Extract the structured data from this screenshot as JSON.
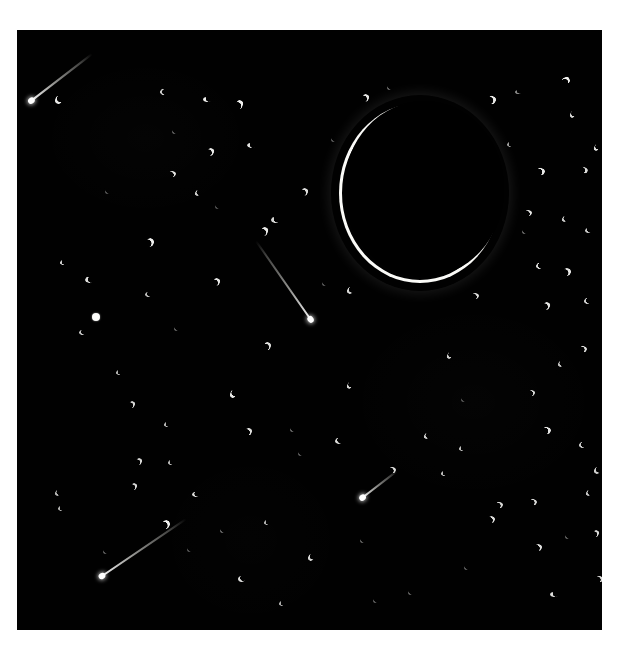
{
  "page": {
    "background_color": "#ffffff",
    "caption": "",
    "plate": {
      "label": "night-sky-exposure",
      "background_color": "#000000",
      "left": 17,
      "top": 30,
      "width": 585,
      "height": 600
    }
  },
  "scene": {
    "title": "Night sky long exposure with crescent moon",
    "moon": {
      "name": "crescent-moon",
      "shape": "thin crescent ring, open toward upper-right",
      "color": "#ffffff",
      "center_x": 403,
      "center_y": 163,
      "radius": 81,
      "ring_thickness_px": 6,
      "brightest_region": "bottom-left limb"
    },
    "streak_color": "#e8e8e4",
    "star_color": "#fdfdfb",
    "star_shape": "small crescent / comma-shaped blobs",
    "counts": {
      "stars": 96,
      "meteor_streaks": 4
    },
    "meteors": [
      {
        "name": "meteor-streak-top-left",
        "x1": 92,
        "y1": 54,
        "x2": 31,
        "y2": 101,
        "length": 77,
        "angle_deg": 142
      },
      {
        "name": "meteor-streak-center",
        "x1": 256,
        "y1": 241,
        "x2": 311,
        "y2": 320,
        "length": 96,
        "angle_deg": 55
      },
      {
        "name": "meteor-streak-bottom-mid",
        "x1": 397,
        "y1": 471,
        "x2": 362,
        "y2": 498,
        "length": 44,
        "angle_deg": 142
      },
      {
        "name": "meteor-streak-bottom-left",
        "x1": 186,
        "y1": 519,
        "x2": 102,
        "y2": 576,
        "length": 101,
        "angle_deg": 146
      }
    ],
    "stars": [
      {
        "x": 38,
        "y": 66,
        "w": 7,
        "h": 8,
        "r": 10,
        "o": 0.92
      },
      {
        "x": 143,
        "y": 59,
        "w": 6,
        "h": 6,
        "r": 40,
        "o": 0.8
      },
      {
        "x": 186,
        "y": 67,
        "w": 8,
        "h": 5,
        "r": 5,
        "o": 0.95
      },
      {
        "x": 219,
        "y": 70,
        "w": 7,
        "h": 9,
        "r": 195,
        "o": 0.95
      },
      {
        "x": 345,
        "y": 64,
        "w": 7,
        "h": 8,
        "r": 200,
        "o": 0.9
      },
      {
        "x": 370,
        "y": 56,
        "w": 4,
        "h": 4,
        "r": 0,
        "o": 0.45
      },
      {
        "x": 471,
        "y": 66,
        "w": 8,
        "h": 8,
        "r": 210,
        "o": 0.92
      },
      {
        "x": 498,
        "y": 60,
        "w": 6,
        "h": 4,
        "r": 0,
        "o": 0.55
      },
      {
        "x": 545,
        "y": 47,
        "w": 8,
        "h": 7,
        "r": 160,
        "o": 0.95
      },
      {
        "x": 553,
        "y": 81,
        "w": 5,
        "h": 7,
        "r": 15,
        "o": 0.85
      },
      {
        "x": 190,
        "y": 118,
        "w": 7,
        "h": 8,
        "r": 205,
        "o": 0.92
      },
      {
        "x": 230,
        "y": 113,
        "w": 8,
        "h": 5,
        "r": 10,
        "o": 0.9
      },
      {
        "x": 155,
        "y": 100,
        "w": 4,
        "h": 4,
        "r": 0,
        "o": 0.4
      },
      {
        "x": 577,
        "y": 114,
        "w": 5,
        "h": 7,
        "r": 20,
        "o": 0.88
      },
      {
        "x": 152,
        "y": 141,
        "w": 7,
        "h": 6,
        "r": 190,
        "o": 0.9
      },
      {
        "x": 178,
        "y": 160,
        "w": 5,
        "h": 6,
        "r": 25,
        "o": 0.82
      },
      {
        "x": 520,
        "y": 138,
        "w": 8,
        "h": 7,
        "r": 200,
        "o": 0.92
      },
      {
        "x": 563,
        "y": 137,
        "w": 8,
        "h": 6,
        "r": 205,
        "o": 0.88
      },
      {
        "x": 284,
        "y": 158,
        "w": 7,
        "h": 8,
        "r": 200,
        "o": 0.88
      },
      {
        "x": 244,
        "y": 197,
        "w": 7,
        "h": 9,
        "r": 200,
        "o": 0.92
      },
      {
        "x": 508,
        "y": 180,
        "w": 7,
        "h": 6,
        "r": 190,
        "o": 0.9
      },
      {
        "x": 545,
        "y": 186,
        "w": 5,
        "h": 6,
        "r": 25,
        "o": 0.8
      },
      {
        "x": 568,
        "y": 198,
        "w": 6,
        "h": 5,
        "r": 5,
        "o": 0.8
      },
      {
        "x": 254,
        "y": 187,
        "w": 8,
        "h": 6,
        "r": 10,
        "o": 0.85
      },
      {
        "x": 129,
        "y": 208,
        "w": 8,
        "h": 9,
        "r": 205,
        "o": 0.95
      },
      {
        "x": 43,
        "y": 230,
        "w": 5,
        "h": 5,
        "r": 25,
        "o": 0.82
      },
      {
        "x": 505,
        "y": 200,
        "w": 4,
        "h": 4,
        "r": 0,
        "o": 0.45
      },
      {
        "x": 546,
        "y": 238,
        "w": 8,
        "h": 8,
        "r": 200,
        "o": 0.92
      },
      {
        "x": 519,
        "y": 233,
        "w": 6,
        "h": 6,
        "r": 30,
        "o": 0.85
      },
      {
        "x": 68,
        "y": 247,
        "w": 8,
        "h": 6,
        "r": 20,
        "o": 0.88
      },
      {
        "x": 196,
        "y": 248,
        "w": 7,
        "h": 8,
        "r": 200,
        "o": 0.9
      },
      {
        "x": 330,
        "y": 257,
        "w": 6,
        "h": 7,
        "r": 20,
        "o": 0.85
      },
      {
        "x": 455,
        "y": 263,
        "w": 7,
        "h": 6,
        "r": 190,
        "o": 0.88
      },
      {
        "x": 128,
        "y": 262,
        "w": 6,
        "h": 5,
        "r": 15,
        "o": 0.75
      },
      {
        "x": 526,
        "y": 272,
        "w": 7,
        "h": 8,
        "r": 205,
        "o": 0.9
      },
      {
        "x": 567,
        "y": 268,
        "w": 6,
        "h": 6,
        "r": 25,
        "o": 0.82
      },
      {
        "x": 75,
        "y": 283,
        "w": 8,
        "h": 8,
        "r": 0,
        "o": 1.0,
        "blob": true
      },
      {
        "x": 62,
        "y": 300,
        "w": 6,
        "h": 5,
        "r": 15,
        "o": 0.78
      },
      {
        "x": 247,
        "y": 312,
        "w": 7,
        "h": 8,
        "r": 195,
        "o": 0.88
      },
      {
        "x": 157,
        "y": 297,
        "w": 4,
        "h": 4,
        "r": 0,
        "o": 0.42
      },
      {
        "x": 430,
        "y": 322,
        "w": 5,
        "h": 7,
        "r": 20,
        "o": 0.82
      },
      {
        "x": 563,
        "y": 316,
        "w": 7,
        "h": 6,
        "r": 200,
        "o": 0.88
      },
      {
        "x": 99,
        "y": 340,
        "w": 5,
        "h": 5,
        "r": 25,
        "o": 0.7
      },
      {
        "x": 330,
        "y": 352,
        "w": 5,
        "h": 7,
        "r": 18,
        "o": 0.85
      },
      {
        "x": 512,
        "y": 360,
        "w": 6,
        "h": 6,
        "r": 200,
        "o": 0.85
      },
      {
        "x": 541,
        "y": 331,
        "w": 5,
        "h": 6,
        "r": 22,
        "o": 0.78
      },
      {
        "x": 213,
        "y": 360,
        "w": 6,
        "h": 8,
        "r": 12,
        "o": 0.92
      },
      {
        "x": 112,
        "y": 371,
        "w": 6,
        "h": 7,
        "r": 200,
        "o": 0.85
      },
      {
        "x": 147,
        "y": 392,
        "w": 5,
        "h": 5,
        "r": 20,
        "o": 0.72
      },
      {
        "x": 228,
        "y": 398,
        "w": 7,
        "h": 7,
        "r": 195,
        "o": 0.88
      },
      {
        "x": 273,
        "y": 398,
        "w": 4,
        "h": 4,
        "r": 0,
        "o": 0.45
      },
      {
        "x": 318,
        "y": 408,
        "w": 7,
        "h": 6,
        "r": 10,
        "o": 0.88
      },
      {
        "x": 407,
        "y": 403,
        "w": 5,
        "h": 6,
        "r": 24,
        "o": 0.82
      },
      {
        "x": 442,
        "y": 416,
        "w": 5,
        "h": 5,
        "r": 20,
        "o": 0.75
      },
      {
        "x": 526,
        "y": 397,
        "w": 8,
        "h": 7,
        "r": 200,
        "o": 0.9
      },
      {
        "x": 562,
        "y": 412,
        "w": 6,
        "h": 6,
        "r": 25,
        "o": 0.8
      },
      {
        "x": 119,
        "y": 428,
        "w": 6,
        "h": 7,
        "r": 198,
        "o": 0.85
      },
      {
        "x": 151,
        "y": 430,
        "w": 5,
        "h": 5,
        "r": 18,
        "o": 0.72
      },
      {
        "x": 281,
        "y": 422,
        "w": 4,
        "h": 4,
        "r": 0,
        "o": 0.4
      },
      {
        "x": 372,
        "y": 437,
        "w": 7,
        "h": 6,
        "r": 195,
        "o": 0.88
      },
      {
        "x": 424,
        "y": 441,
        "w": 5,
        "h": 5,
        "r": 22,
        "o": 0.75
      },
      {
        "x": 114,
        "y": 453,
        "w": 6,
        "h": 7,
        "r": 200,
        "o": 0.85
      },
      {
        "x": 175,
        "y": 462,
        "w": 7,
        "h": 5,
        "r": 8,
        "o": 0.88
      },
      {
        "x": 41,
        "y": 476,
        "w": 5,
        "h": 5,
        "r": 20,
        "o": 0.7
      },
      {
        "x": 471,
        "y": 486,
        "w": 7,
        "h": 7,
        "r": 198,
        "o": 0.88
      },
      {
        "x": 513,
        "y": 469,
        "w": 7,
        "h": 6,
        "r": 200,
        "o": 0.86
      },
      {
        "x": 569,
        "y": 460,
        "w": 5,
        "h": 6,
        "r": 25,
        "o": 0.78
      },
      {
        "x": 145,
        "y": 490,
        "w": 8,
        "h": 9,
        "r": 200,
        "o": 0.95
      },
      {
        "x": 203,
        "y": 499,
        "w": 4,
        "h": 4,
        "r": 0,
        "o": 0.45
      },
      {
        "x": 247,
        "y": 490,
        "w": 5,
        "h": 5,
        "r": 20,
        "o": 0.7
      },
      {
        "x": 577,
        "y": 437,
        "w": 6,
        "h": 7,
        "r": 18,
        "o": 0.82
      },
      {
        "x": 38,
        "y": 460,
        "w": 5,
        "h": 6,
        "r": 22,
        "o": 0.72
      },
      {
        "x": 343,
        "y": 509,
        "w": 4,
        "h": 4,
        "r": 0,
        "o": 0.42
      },
      {
        "x": 291,
        "y": 524,
        "w": 6,
        "h": 7,
        "r": 15,
        "o": 0.85
      },
      {
        "x": 221,
        "y": 546,
        "w": 7,
        "h": 6,
        "r": 5,
        "o": 0.88
      },
      {
        "x": 479,
        "y": 472,
        "w": 7,
        "h": 6,
        "r": 196,
        "o": 0.85
      },
      {
        "x": 518,
        "y": 514,
        "w": 7,
        "h": 7,
        "r": 200,
        "o": 0.88
      },
      {
        "x": 548,
        "y": 505,
        "w": 4,
        "h": 4,
        "r": 0,
        "o": 0.42
      },
      {
        "x": 576,
        "y": 500,
        "w": 6,
        "h": 7,
        "r": 200,
        "o": 0.86
      },
      {
        "x": 579,
        "y": 546,
        "w": 7,
        "h": 6,
        "r": 195,
        "o": 0.88
      },
      {
        "x": 533,
        "y": 562,
        "w": 8,
        "h": 5,
        "r": 5,
        "o": 0.88
      },
      {
        "x": 262,
        "y": 571,
        "w": 5,
        "h": 5,
        "r": 20,
        "o": 0.68
      },
      {
        "x": 356,
        "y": 569,
        "w": 4,
        "h": 4,
        "r": 0,
        "o": 0.4
      },
      {
        "x": 391,
        "y": 561,
        "w": 4,
        "h": 4,
        "r": 0,
        "o": 0.42
      },
      {
        "x": 119,
        "y": 602,
        "w": 8,
        "h": 8,
        "r": 200,
        "o": 0.95
      },
      {
        "x": 355,
        "y": 605,
        "w": 6,
        "h": 7,
        "r": 20,
        "o": 0.85
      },
      {
        "x": 529,
        "y": 612,
        "w": 7,
        "h": 8,
        "r": 200,
        "o": 0.92
      },
      {
        "x": 447,
        "y": 536,
        "w": 4,
        "h": 4,
        "r": 0,
        "o": 0.4
      },
      {
        "x": 86,
        "y": 520,
        "w": 4,
        "h": 4,
        "r": 0,
        "o": 0.4
      },
      {
        "x": 305,
        "y": 252,
        "w": 4,
        "h": 4,
        "r": 0,
        "o": 0.38
      },
      {
        "x": 198,
        "y": 175,
        "w": 4,
        "h": 4,
        "r": 0,
        "o": 0.35
      },
      {
        "x": 490,
        "y": 112,
        "w": 5,
        "h": 5,
        "r": 20,
        "o": 0.62
      },
      {
        "x": 314,
        "y": 108,
        "w": 4,
        "h": 4,
        "r": 0,
        "o": 0.38
      },
      {
        "x": 88,
        "y": 160,
        "w": 4,
        "h": 4,
        "r": 0,
        "o": 0.36
      },
      {
        "x": 444,
        "y": 368,
        "w": 4,
        "h": 4,
        "r": 0,
        "o": 0.36
      },
      {
        "x": 170,
        "y": 518,
        "w": 4,
        "h": 4,
        "r": 0,
        "o": 0.36
      },
      {
        "x": 600,
        "y": 350,
        "w": 4,
        "h": 4,
        "r": 0,
        "o": 0.34
      }
    ]
  }
}
